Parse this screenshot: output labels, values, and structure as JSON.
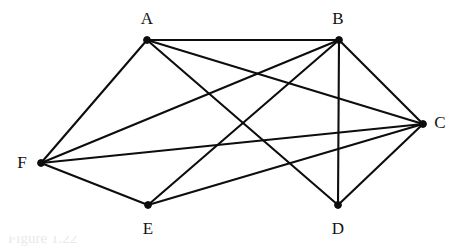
{
  "figure": {
    "background_color": "#ffffff",
    "edge_color": "#0d0d0d",
    "vertex_color": "#0d0d0d",
    "label_color": "#121212",
    "width": 459,
    "height": 252
  },
  "graph": {
    "type": "undirected",
    "vertex_count": 6,
    "edge_count": 12,
    "vertices": [
      {
        "id": "A",
        "label": "A",
        "x": 147,
        "y": 40,
        "label_x": 147,
        "label_y": 18,
        "degree": 4
      },
      {
        "id": "B",
        "label": "B",
        "x": 339,
        "y": 40,
        "label_x": 338,
        "label_y": 18,
        "degree": 5
      },
      {
        "id": "C",
        "label": "C",
        "x": 423,
        "y": 124,
        "label_x": 440,
        "label_y": 122,
        "degree": 5
      },
      {
        "id": "D",
        "label": "D",
        "x": 338,
        "y": 205,
        "label_x": 338,
        "label_y": 228,
        "degree": 3
      },
      {
        "id": "E",
        "label": "E",
        "x": 148,
        "y": 205,
        "label_x": 148,
        "label_y": 228,
        "degree": 3
      },
      {
        "id": "F",
        "label": "F",
        "x": 41,
        "y": 163,
        "label_x": 22,
        "label_y": 162,
        "degree": 4
      }
    ],
    "edges": [
      {
        "from": "A",
        "to": "B"
      },
      {
        "from": "A",
        "to": "C"
      },
      {
        "from": "A",
        "to": "D"
      },
      {
        "from": "A",
        "to": "F"
      },
      {
        "from": "B",
        "to": "C"
      },
      {
        "from": "B",
        "to": "D"
      },
      {
        "from": "B",
        "to": "E"
      },
      {
        "from": "B",
        "to": "F"
      },
      {
        "from": "C",
        "to": "D"
      },
      {
        "from": "C",
        "to": "E"
      },
      {
        "from": "C",
        "to": "F"
      },
      {
        "from": "E",
        "to": "F"
      }
    ]
  },
  "caption": {
    "text": "Figure 1.22"
  }
}
